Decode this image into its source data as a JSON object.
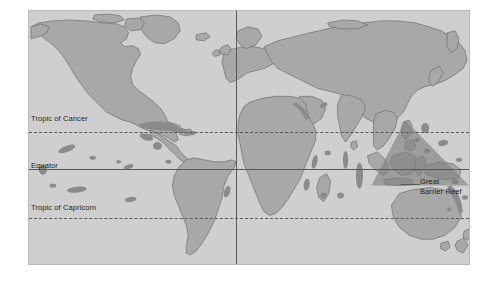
{
  "figure": {
    "type": "thematic-world-map",
    "projection_note": "equirectangular world map",
    "background_color": "#ffffff",
    "ocean_color": "#cfcfcf",
    "land_color": "#a8a8a8",
    "land_outline_color": "#6d6e71",
    "reef_color": "#8d8d8d",
    "highlight_color": "#8a8a8a",
    "graticule_color": "#58595b",
    "label_color": "#231f20"
  },
  "graticule": {
    "lines": [
      {
        "id": "tropic-of-cancer",
        "label": "Tropic of Cancer",
        "style": "dashed",
        "orientation": "horizontal",
        "y_px": 121,
        "label_x_px": 2,
        "label_y_px": 103
      },
      {
        "id": "equator",
        "label": "Equator",
        "style": "solid",
        "orientation": "horizontal",
        "y_px": 158,
        "label_x_px": 2,
        "label_y_px": 150
      },
      {
        "id": "tropic-of-capricorn",
        "label": "Tropic of Capricorn",
        "style": "dashed",
        "orientation": "horizontal",
        "y_px": 207,
        "label_x_px": 2,
        "label_y_px": 192
      },
      {
        "id": "prime-meridian",
        "label": "",
        "style": "solid",
        "orientation": "vertical",
        "x_px": 207
      }
    ]
  },
  "annotations": [
    {
      "id": "great-barrier-reef",
      "line1": "Great",
      "line2": "Barrier Reef",
      "label_x_px": 391,
      "label_y_px": 166,
      "leader_from_x_px": 372,
      "leader_to_x_px": 391,
      "leader_y_px": 173
    }
  ],
  "highlight_regions": [
    {
      "id": "coral-triangle",
      "label": "",
      "shape": "triangle",
      "note": "dark shaded triangle over Southeast Asia / Indonesia / Philippines"
    }
  ]
}
